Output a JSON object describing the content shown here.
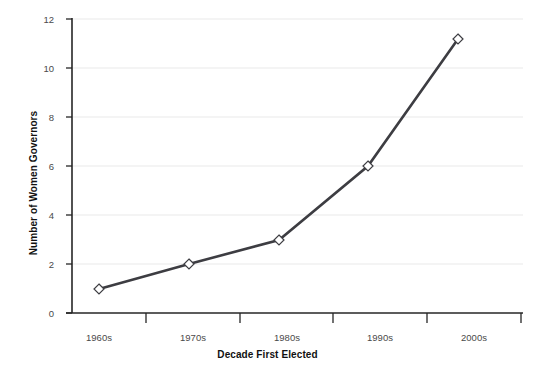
{
  "chart_data": {
    "type": "line",
    "title": "",
    "xlabel": "Decade First Elected",
    "ylabel": "Number of Women Governors",
    "categories": [
      "1960s",
      "1970s",
      "1980s",
      "1990s",
      "2000s"
    ],
    "values": [
      1,
      2,
      3,
      6,
      11.2
    ],
    "series": [
      {
        "name": "Number of Women Governors",
        "values": [
          1,
          2,
          3,
          6,
          11.2
        ]
      }
    ],
    "ylim": [
      0,
      12
    ],
    "yticks": [
      0,
      2,
      4,
      6,
      8,
      10,
      12
    ],
    "ytick_labels": [
      "0",
      "2",
      "4",
      "6",
      "8",
      "10",
      "12"
    ],
    "grid": "horizontal",
    "legend": "none",
    "marker": "open-diamond",
    "line_color": "#3d3d42",
    "marker_edge_color": "#3d3d42",
    "marker_face_color": "#ffffff",
    "grid_color": "#e8e8e8",
    "axis_color": "#1a1a1a",
    "tick_label_color": "#4a4a4a",
    "axis_title_color": "#111111",
    "background_color": "#ffffff"
  }
}
